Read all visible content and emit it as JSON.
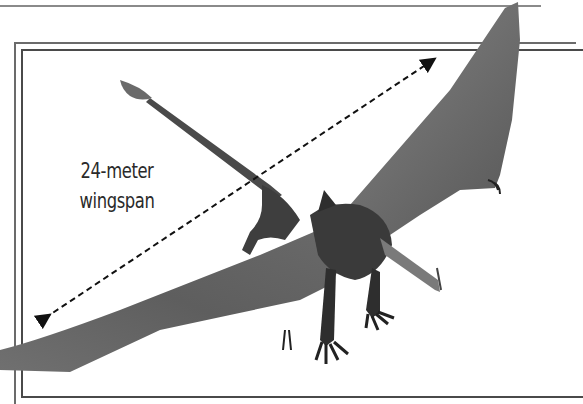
{
  "illustration": {
    "subject": "pterosaur",
    "caption_lines": [
      "24-meter",
      "wingspan"
    ],
    "measurement_arrow": "wingspan-double-arrow"
  },
  "colors": {
    "background": "#ffffff",
    "frame": "#4a4a4a",
    "creature": "#6e6e6e",
    "creature_dark": "#3a3a3a",
    "text": "#2a2a2a"
  }
}
